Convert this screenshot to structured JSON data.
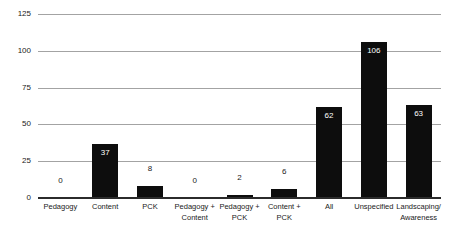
{
  "chart_data": {
    "type": "bar",
    "title": "",
    "xlabel": "",
    "ylabel": "",
    "categories": [
      "Pedagogy",
      "Content",
      "PCK",
      "Pedagogy +\nContent",
      "Pedagogy +\nPCK",
      "Content +\nPCK",
      "All",
      "Unspecified",
      "Landscaping/\nAwareness"
    ],
    "values": [
      0,
      37,
      8,
      0,
      2,
      6,
      62,
      106,
      63
    ],
    "ylim": [
      0,
      125
    ],
    "yticks": [
      0,
      25,
      50,
      75,
      100,
      125
    ],
    "grid": true,
    "legend": false,
    "colors": {
      "bar": "#0d0d0d",
      "gridline": "#a3a3a3",
      "axis": "#2b2b2b",
      "tick_text": "#1a1a1a",
      "value_inside": "#ffffff",
      "value_outside": "#1a1a1a",
      "background": "#ffffff"
    }
  }
}
